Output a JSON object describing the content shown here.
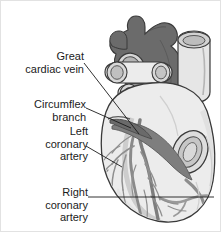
{
  "figure": {
    "background_color": "#ffffff",
    "border_color": "#e2e2e2",
    "width": 222,
    "height": 233
  },
  "palette": {
    "dark_vessel": "#6b6b6b",
    "mid_vessel": "#8e8e8e",
    "light_tissue": "#e0e0e0",
    "pale_tissue": "#ececec",
    "shadow": "#bcbcbc",
    "outline": "#3a3a3a",
    "leader_line": "#1b1b1b",
    "text": "#1b1b1b"
  },
  "labels": [
    {
      "id": "great-cardiac-vein",
      "text": "Great\ncardiac vein",
      "line_color": "#1b1b1b"
    },
    {
      "id": "circumflex-branch",
      "text": "Circumflex\nbranch",
      "line_color": "#1b1b1b"
    },
    {
      "id": "left-coronary-artery",
      "text": "Left\ncoronary\nartery",
      "line_color": "#1b1b1b"
    },
    {
      "id": "right-coronary-artery",
      "text": "Right\ncoronary\nartery",
      "line_color": "#1b1b1b"
    }
  ],
  "structures": [
    {
      "id": "aorta-and-pulmonary-trunk",
      "shade": "dark"
    },
    {
      "id": "superior-vena-cava",
      "shade": "light"
    },
    {
      "id": "pulmonary-veins",
      "shade": "light"
    },
    {
      "id": "right-atrium",
      "shade": "light"
    },
    {
      "id": "left-ventricle",
      "shade": "pale"
    },
    {
      "id": "right-ventricle",
      "shade": "pale"
    },
    {
      "id": "great-cardiac-vein-vessel",
      "shade": "mid"
    },
    {
      "id": "circumflex-branch-vessel",
      "shade": "dark"
    },
    {
      "id": "left-coronary-artery-vessel",
      "shade": "mid"
    },
    {
      "id": "right-coronary-artery-vessel",
      "shade": "mid"
    },
    {
      "id": "coronary-capillary-network",
      "shade": "mid"
    }
  ]
}
